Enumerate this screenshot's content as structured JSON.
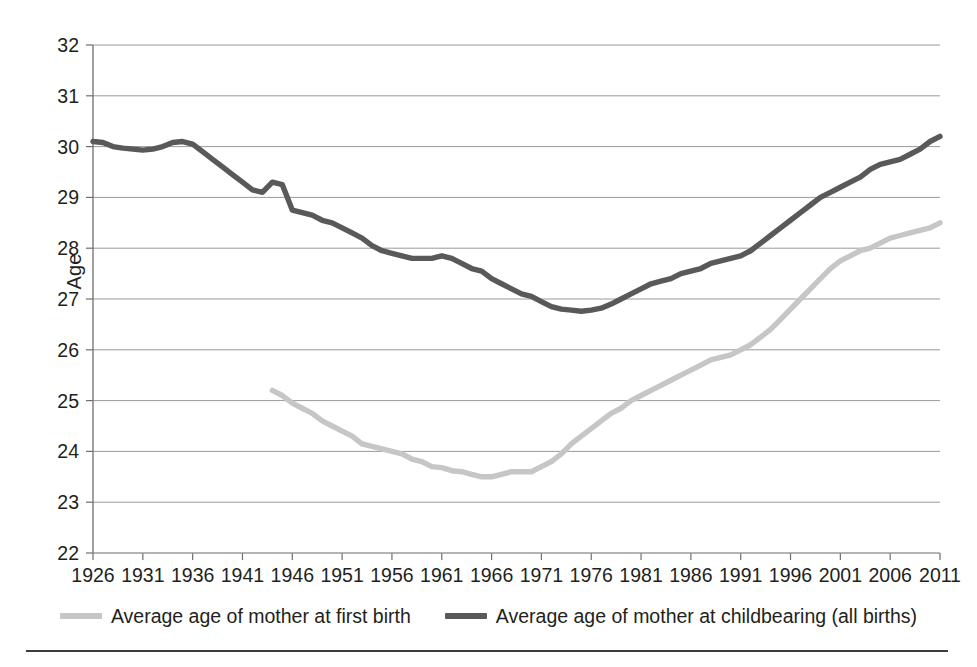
{
  "chart_data": {
    "type": "line",
    "title": "",
    "xlabel": "",
    "ylabel": "Age",
    "ylim": [
      22,
      32
    ],
    "xlim": [
      1926,
      2011
    ],
    "ytick_step": 1,
    "xtick_step": 5,
    "grid": true,
    "legend_position": "bottom",
    "yticks": [
      22,
      23,
      24,
      25,
      26,
      27,
      28,
      29,
      30,
      31,
      32
    ],
    "xticks": [
      1926,
      1931,
      1936,
      1941,
      1946,
      1951,
      1956,
      1961,
      1966,
      1971,
      1976,
      1981,
      1986,
      1991,
      1996,
      2001,
      2006,
      2011
    ],
    "x": [
      1926,
      1927,
      1928,
      1929,
      1930,
      1931,
      1932,
      1933,
      1934,
      1935,
      1936,
      1937,
      1938,
      1939,
      1940,
      1941,
      1942,
      1943,
      1944,
      1945,
      1946,
      1947,
      1948,
      1949,
      1950,
      1951,
      1952,
      1953,
      1954,
      1955,
      1956,
      1957,
      1958,
      1959,
      1960,
      1961,
      1962,
      1963,
      1964,
      1965,
      1966,
      1967,
      1968,
      1969,
      1970,
      1971,
      1972,
      1973,
      1974,
      1975,
      1976,
      1977,
      1978,
      1979,
      1980,
      1981,
      1982,
      1983,
      1984,
      1985,
      1986,
      1987,
      1988,
      1989,
      1990,
      1991,
      1992,
      1993,
      1994,
      1995,
      1996,
      1997,
      1998,
      1999,
      2000,
      2001,
      2002,
      2003,
      2004,
      2005,
      2006,
      2007,
      2008,
      2009,
      2010,
      2011
    ],
    "series": [
      {
        "name": "Average age of mother at childbearing (all births)",
        "color": "#59595b",
        "values": [
          30.1,
          30.08,
          30.0,
          29.97,
          29.95,
          29.93,
          29.95,
          30.0,
          30.08,
          30.1,
          30.05,
          29.9,
          29.75,
          29.6,
          29.45,
          29.3,
          29.15,
          29.1,
          29.3,
          29.25,
          28.75,
          28.7,
          28.65,
          28.55,
          28.5,
          28.4,
          28.3,
          28.2,
          28.05,
          27.95,
          27.9,
          27.85,
          27.8,
          27.8,
          27.8,
          27.85,
          27.8,
          27.7,
          27.6,
          27.55,
          27.4,
          27.3,
          27.2,
          27.1,
          27.05,
          26.95,
          26.85,
          26.8,
          26.78,
          26.76,
          26.78,
          26.82,
          26.9,
          27.0,
          27.1,
          27.2,
          27.3,
          27.35,
          27.4,
          27.5,
          27.55,
          27.6,
          27.7,
          27.75,
          27.8,
          27.85,
          27.95,
          28.1,
          28.25,
          28.4,
          28.55,
          28.7,
          28.85,
          29.0,
          29.1,
          29.2,
          29.3,
          29.4,
          29.55,
          29.65,
          29.7,
          29.75,
          29.85,
          29.95,
          30.1,
          30.2
        ]
      },
      {
        "name": "Average age of mother at first birth",
        "color": "#c6c6c6",
        "values": [
          null,
          null,
          null,
          null,
          null,
          null,
          null,
          null,
          null,
          null,
          null,
          null,
          null,
          null,
          null,
          null,
          null,
          null,
          25.2,
          25.1,
          24.95,
          24.85,
          24.75,
          24.6,
          24.5,
          24.4,
          24.3,
          24.15,
          24.1,
          24.05,
          24.0,
          23.95,
          23.85,
          23.8,
          23.7,
          23.68,
          23.62,
          23.6,
          23.55,
          23.5,
          23.5,
          23.55,
          23.6,
          23.6,
          23.6,
          23.7,
          23.8,
          23.95,
          24.15,
          24.3,
          24.45,
          24.6,
          24.75,
          24.85,
          25.0,
          25.1,
          25.2,
          25.3,
          25.4,
          25.5,
          25.6,
          25.7,
          25.8,
          25.85,
          25.9,
          26.0,
          26.1,
          26.25,
          26.4,
          26.6,
          26.8,
          27.0,
          27.2,
          27.4,
          27.6,
          27.75,
          27.85,
          27.95,
          28.0,
          28.1,
          28.2,
          28.25,
          28.3,
          28.35,
          28.4,
          28.5
        ]
      }
    ]
  },
  "axis": {
    "y_title": "Age"
  },
  "legend": {
    "entries": [
      {
        "label": "Average age of mother at first birth",
        "color": "#c6c6c6",
        "swatch": "line-swatch-light"
      },
      {
        "label": "Average age of mother at childbearing (all births)",
        "color": "#59595b",
        "swatch": "line-swatch-dark"
      }
    ]
  }
}
